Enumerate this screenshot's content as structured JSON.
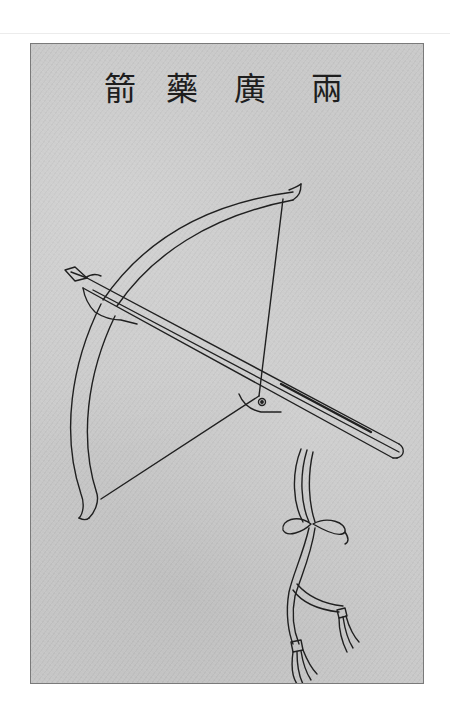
{
  "plate": {
    "title_chars": [
      "箭",
      "藥",
      "廣",
      "兩"
    ],
    "title_reading": "兩廣藥箭",
    "subject": "crossbow illustration",
    "paper_color": "#c9c9c9",
    "ink_color": "#202020"
  }
}
